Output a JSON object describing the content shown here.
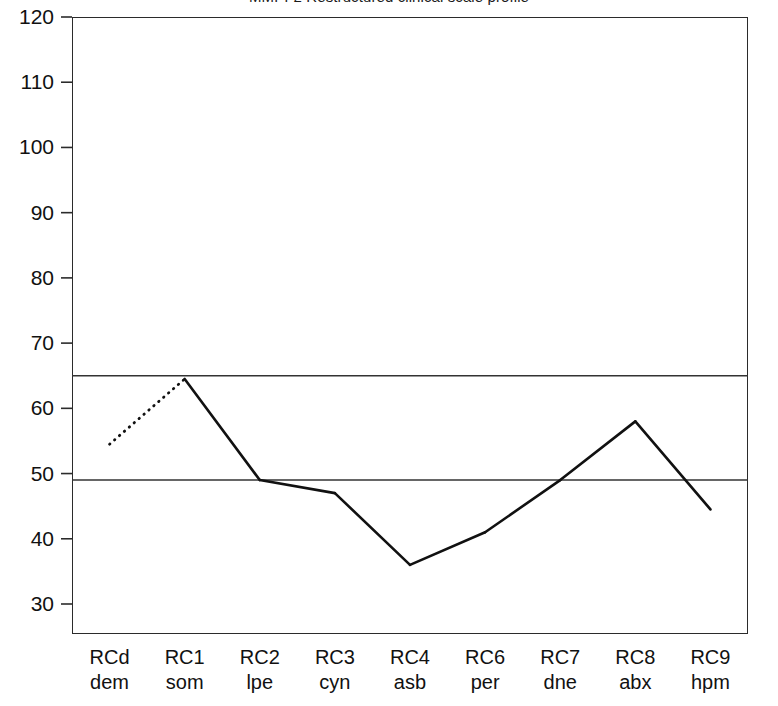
{
  "chart_data": {
    "type": "line",
    "title": "MMPI-2 Restructured clinical scale profile",
    "xlabel": "",
    "ylabel": "",
    "ylim": [
      25.4,
      120
    ],
    "yticks": [
      30,
      40,
      50,
      60,
      70,
      80,
      90,
      100,
      110,
      120
    ],
    "ytick_labels": [
      "30",
      "40",
      "50",
      "60",
      "70",
      "80",
      "90",
      "100",
      "110",
      "120"
    ],
    "grid": false,
    "legend": "none",
    "categories": [
      "RCd",
      "RC1",
      "RC2",
      "RC3",
      "RC4",
      "RC6",
      "RC7",
      "RC8",
      "RC9"
    ],
    "category_abbrs": [
      "dem",
      "som",
      "lpe",
      "cyn",
      "asb",
      "per",
      "dne",
      "abx",
      "hpm"
    ],
    "series": [
      {
        "name": "T score",
        "values": [
          54.5,
          64.5,
          49.0,
          47.0,
          36.0,
          41.0,
          49.0,
          58.0,
          44.5
        ],
        "color": "#111111",
        "linewidth": 2.6,
        "dotted_segments": [
          0
        ]
      }
    ],
    "reference_lines": [
      {
        "name": "upper-cutoff",
        "value": 65,
        "color": "#333333"
      },
      {
        "name": "lower-cutoff",
        "value": 49,
        "color": "#333333"
      }
    ]
  }
}
